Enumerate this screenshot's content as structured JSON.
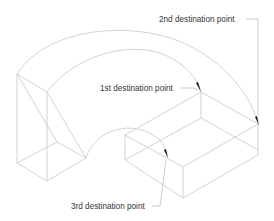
{
  "diagram": {
    "type": "isometric-path-illustration",
    "labels": {
      "first": "1st destination point",
      "second": "2nd destination point",
      "third": "3rd destination point"
    },
    "colors": {
      "lines": "#c8c8c8",
      "text": "#333333",
      "arrows": "#1a1a1a"
    }
  }
}
